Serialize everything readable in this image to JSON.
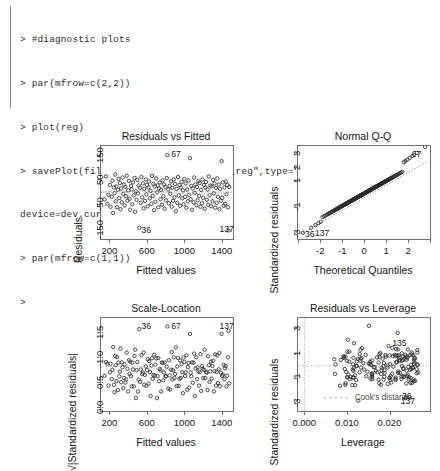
{
  "console": {
    "lines": [
      "> #diagnostic plots",
      "> par(mfrow=c(2,2))",
      "> plot(reg)",
      "> savePlot(filename=\"Rbuilt_in_plots_reg\",type=\"png\",",
      "device=dev.cur())",
      "> par(mfrow=c(1,1))",
      ">"
    ]
  },
  "colors": {
    "point_stroke": "#2a2a2a",
    "trend_line": "#9b9b9b",
    "frame": "#6f6f6f",
    "text": "#141414",
    "background": "#ffffff"
  },
  "chart_data": [
    {
      "type": "scatter",
      "title": "Residuals vs Fitted",
      "xlabel": "Fitted values",
      "ylabel": "Residuals",
      "xlim": [
        110,
        1520
      ],
      "ylim": [
        -190,
        185
      ],
      "xticks": [
        200,
        600,
        1000,
        1400
      ],
      "xtick_labels": [
        "200",
        "600",
        "1000",
        "1400"
      ],
      "yticks": [
        -150,
        -50,
        50,
        150
      ],
      "ytick_labels": [
        "-150",
        "-50",
        "50",
        "150"
      ],
      "grid": false,
      "reference_line": {
        "type": "horizontal",
        "y": 0
      },
      "annotations": [
        {
          "label": "67",
          "x": 840,
          "y": 148
        },
        {
          "label": "36",
          "x": 520,
          "y": -157
        },
        {
          "label": "137",
          "x": 1355,
          "y": -152
        }
      ],
      "x": [
        148,
        163,
        178,
        190,
        205,
        212,
        225,
        232,
        240,
        248,
        255,
        262,
        268,
        275,
        282,
        290,
        297,
        305,
        312,
        318,
        325,
        332,
        340,
        348,
        355,
        362,
        370,
        378,
        385,
        392,
        400,
        408,
        415,
        422,
        430,
        438,
        445,
        452,
        460,
        468,
        475,
        483,
        490,
        498,
        505,
        512,
        520,
        528,
        535,
        542,
        550,
        558,
        565,
        572,
        580,
        588,
        595,
        602,
        610,
        618,
        625,
        632,
        640,
        648,
        655,
        662,
        670,
        678,
        685,
        692,
        700,
        708,
        715,
        722,
        730,
        738,
        745,
        752,
        760,
        768,
        775,
        782,
        790,
        798,
        805,
        812,
        820,
        828,
        835,
        842,
        850,
        858,
        865,
        872,
        880,
        888,
        895,
        902,
        910,
        918,
        925,
        932,
        940,
        948,
        955,
        962,
        970,
        978,
        985,
        992,
        1000,
        1008,
        1015,
        1022,
        1030,
        1038,
        1045,
        1052,
        1060,
        1068,
        1075,
        1082,
        1090,
        1098,
        1105,
        1112,
        1120,
        1128,
        1135,
        1142,
        1150,
        1158,
        1165,
        1172,
        1180,
        1188,
        1195,
        1202,
        1210,
        1218,
        1225,
        1232,
        1240,
        1248,
        1255,
        1262,
        1270,
        1278,
        1285,
        1292,
        1300,
        1308,
        1315,
        1322,
        1330,
        1338,
        1345,
        1352,
        1360,
        1368,
        1375,
        1382,
        1390,
        1398,
        1405,
        1412,
        1420,
        1428,
        1435,
        1442,
        1450,
        1458,
        1465,
        1472,
        1480
      ],
      "y": [
        -30,
        62,
        -48,
        -12,
        28,
        -60,
        -20,
        45,
        -85,
        18,
        -5,
        70,
        -38,
        22,
        -62,
        8,
        52,
        -25,
        36,
        -70,
        14,
        -42,
        58,
        -8,
        30,
        -55,
        20,
        -18,
        65,
        -35,
        6,
        44,
        -28,
        -72,
        24,
        10,
        -50,
        38,
        -14,
        56,
        -80,
        2,
        -32,
        48,
        -6,
        26,
        -145,
        16,
        -44,
        60,
        -22,
        34,
        -66,
        12,
        -36,
        50,
        -10,
        28,
        -58,
        18,
        42,
        -26,
        4,
        -48,
        64,
        -16,
        32,
        -74,
        22,
        -40,
        54,
        -2,
        26,
        -62,
        14,
        38,
        -30,
        8,
        -52,
        46,
        -18,
        30,
        -68,
        20,
        -34,
        56,
        148,
        10,
        -46,
        24,
        -8,
        42,
        -60,
        16,
        -36,
        50,
        -22,
        32,
        -78,
        12,
        -44,
        60,
        -14,
        28,
        -56,
        18,
        40,
        -26,
        6,
        -50,
        52,
        -20,
        34,
        -64,
        10,
        -38,
        46,
        -12,
        136,
        -30,
        24,
        -72,
        14,
        -42,
        58,
        -4,
        30,
        -54,
        20,
        -34,
        44,
        -16,
        36,
        -60,
        8,
        -46,
        50,
        -24,
        28,
        -68,
        18,
        40,
        -32,
        10,
        -52,
        62,
        -14,
        26,
        -58,
        22,
        -38,
        48,
        -6,
        34,
        -64,
        16,
        -44,
        54,
        -20,
        30,
        -70,
        12,
        -36,
        124,
        -24,
        38,
        -56,
        18,
        -48,
        42,
        -10,
        28,
        -62,
        -156,
        20,
        -40,
        52,
        -18,
        32,
        -58,
        24
      ]
    },
    {
      "type": "scatter",
      "title": "Normal Q-Q",
      "xlabel": "Theoretical Quantiles",
      "ylabel": "Standardized residuals",
      "xlim": [
        -3.0,
        3.0
      ],
      "ylim": [
        -3.4,
        3.6
      ],
      "xticks": [
        -2,
        -1,
        0,
        1,
        2
      ],
      "xtick_labels": [
        "-2",
        "-1",
        "0",
        "1",
        "2"
      ],
      "yticks": [
        -3,
        -1,
        1,
        2,
        3
      ],
      "ytick_labels": [
        "-3",
        "-1",
        "1",
        "2",
        "3"
      ],
      "grid": false,
      "reference_line": {
        "type": "qq-diagonal"
      },
      "annotations": [
        {
          "label": "67",
          "x": 2.35,
          "y": 3.0
        },
        {
          "label": "36",
          "x": -2.5,
          "y": -3.0
        },
        {
          "label": "137",
          "x": -2.05,
          "y": -2.95
        }
      ]
    },
    {
      "type": "scatter",
      "title": "Scale-Location",
      "xlabel": "Fitted values",
      "ylabel": "√|Standardized residuals|",
      "xlim": [
        110,
        1520
      ],
      "ylim": [
        -0.08,
        1.78
      ],
      "xticks": [
        200,
        600,
        1000,
        1400
      ],
      "xtick_labels": [
        "200",
        "600",
        "1000",
        "1400"
      ],
      "yticks": [
        0.0,
        0.5,
        1.0,
        1.5
      ],
      "ytick_labels": [
        "0.0",
        "0.5",
        "1.0",
        "1.5"
      ],
      "grid": false,
      "annotations": [
        {
          "label": "36",
          "x": 520,
          "y": 1.63
        },
        {
          "label": "67",
          "x": 840,
          "y": 1.63
        },
        {
          "label": "137",
          "x": 1355,
          "y": 1.62
        }
      ]
    },
    {
      "type": "scatter",
      "title": "Residuals vs Leverage",
      "xlabel": "Leverage",
      "ylabel": "Standardized residuals",
      "xlim": [
        -0.0015,
        0.0295
      ],
      "ylim": [
        -3.6,
        3.8
      ],
      "xticks": [
        0.0,
        0.01,
        0.02
      ],
      "xtick_labels": [
        "0.000",
        "0.010",
        "0.020"
      ],
      "yticks": [
        -3,
        -1,
        1,
        3
      ],
      "ytick_labels": [
        "-3",
        "-1",
        "1",
        "3"
      ],
      "grid": false,
      "reference_line": {
        "type": "horizontal",
        "y": 0
      },
      "cooks_distance_label": "Cook's distance",
      "annotations": [
        {
          "label": "135",
          "x": 0.0225,
          "y": 1.82
        },
        {
          "label": "36",
          "x": 0.0248,
          "y": -2.42
        },
        {
          "label": "137",
          "x": 0.0245,
          "y": -2.82
        }
      ]
    }
  ]
}
